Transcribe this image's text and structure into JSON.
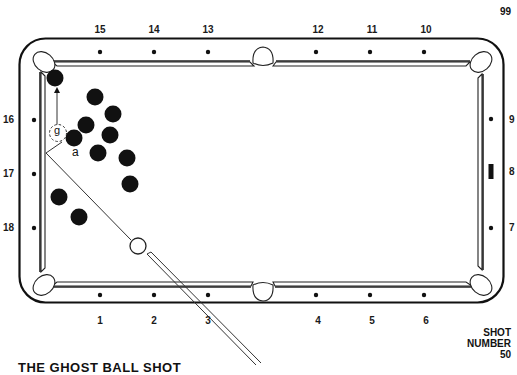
{
  "page_number": "99",
  "shot": {
    "label_line1": "SHOT",
    "label_line2": "NUMBER",
    "number": "50"
  },
  "caption": "THE GHOST BALL SHOT",
  "diamond_labels": {
    "top": [
      "15",
      "14",
      "13",
      "12",
      "11",
      "10"
    ],
    "bottom": [
      "1",
      "2",
      "3",
      "4",
      "5",
      "6"
    ],
    "left": [
      "16",
      "17",
      "18"
    ],
    "right": [
      "9",
      "8",
      "7"
    ]
  },
  "annotations": {
    "ghost_ball": "g",
    "contact_point": "a"
  },
  "colors": {
    "ink": "#111111",
    "background": "#ffffff",
    "object_ball": "#111111",
    "cue_ball_fill": "#ffffff"
  },
  "balls": {
    "object_balls": [
      {
        "x": 55,
        "y": 78
      },
      {
        "x": 95,
        "y": 97
      },
      {
        "x": 113,
        "y": 114
      },
      {
        "x": 86,
        "y": 125
      },
      {
        "x": 74,
        "y": 138
      },
      {
        "x": 110,
        "y": 135
      },
      {
        "x": 98,
        "y": 153
      },
      {
        "x": 127,
        "y": 158
      },
      {
        "x": 130,
        "y": 184
      },
      {
        "x": 59,
        "y": 197
      },
      {
        "x": 79,
        "y": 217
      }
    ],
    "cue_ball": {
      "x": 138,
      "y": 246
    },
    "ghost_ball": {
      "x": 58,
      "y": 133
    }
  }
}
